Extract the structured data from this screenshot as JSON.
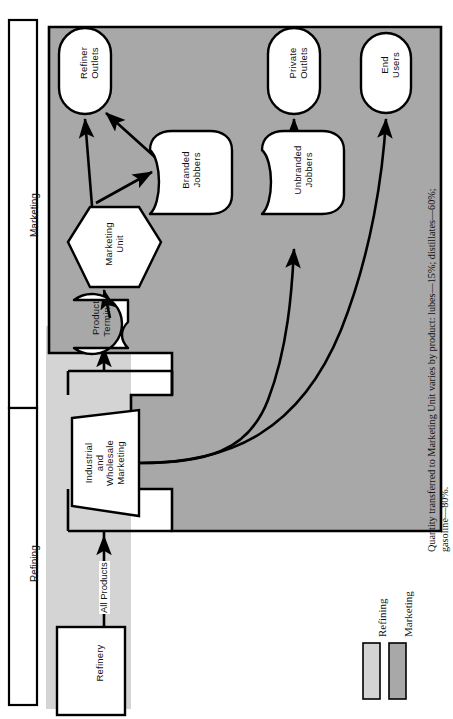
{
  "figure": {
    "orientation": "rotated-90-ccw",
    "brackets": [
      {
        "id": "marketing",
        "label": "Marketing"
      },
      {
        "id": "refining",
        "label": "Refining"
      }
    ],
    "nodes": [
      {
        "id": "refiner-outlets",
        "label": "Refiner\nOutlets",
        "shape": "stadium"
      },
      {
        "id": "private-outlets",
        "label": "Private\nOutlets",
        "shape": "stadium"
      },
      {
        "id": "end-users",
        "label": "End\nUsers",
        "shape": "stadium"
      },
      {
        "id": "branded-jobbers",
        "label": "Branded\nJobbers",
        "shape": "shield"
      },
      {
        "id": "unbranded-jobbers",
        "label": "Unbranded\nJobbers",
        "shape": "shield"
      },
      {
        "id": "marketing-unit",
        "label": "Marketing\nUnit",
        "shape": "hexagon"
      },
      {
        "id": "product-terminal",
        "label": "Product\nTerminal",
        "shape": "cylinder"
      },
      {
        "id": "industrial-wholesale-marketing",
        "label": "Industrial\nand\nWholesale\nMarketing",
        "shape": "trapezoid"
      },
      {
        "id": "refinery",
        "label": "Refinery",
        "shape": "rectangle"
      }
    ],
    "edge_labels": [
      {
        "id": "all-products",
        "label": "All Products"
      }
    ],
    "legend": {
      "items": [
        {
          "id": "legend-refining",
          "label": "Refining",
          "swatch": "#d4d4d4"
        },
        {
          "id": "legend-marketing",
          "label": "Marketing",
          "swatch": "#a8a8a8"
        }
      ]
    },
    "caption": {
      "line1": "Quantity transferred to Marketing Unit varies by product: lubes—15%; distillates—60%;",
      "line2": "gasoline—80%."
    },
    "colors": {
      "refining_fill": "#d4d4d4",
      "marketing_fill": "#a8a8a8",
      "node_fill": "#ffffff",
      "stroke": "#000000",
      "page": "#ffffff"
    }
  }
}
